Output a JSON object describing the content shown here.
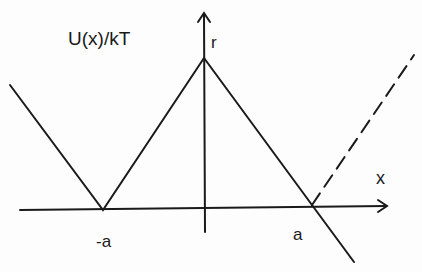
{
  "diagram": {
    "y_axis_label": "U(x)/kT",
    "x_axis_label": "x",
    "peak_label": "r",
    "left_tick_label": "-a",
    "right_tick_label": "a",
    "line_color": "#1a1a1a"
  }
}
